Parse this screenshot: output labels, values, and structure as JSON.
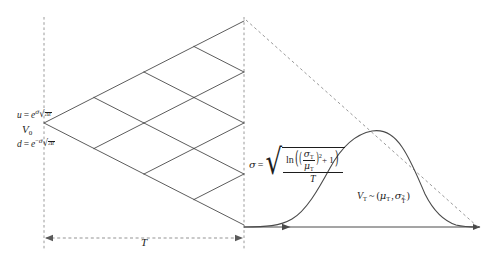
{
  "figure": {
    "domain_kind": "diagram",
    "canvas": {
      "width": 491,
      "height": 260,
      "background": "#ffffff"
    },
    "stroke_color": "#4a4a4a",
    "text_color": "#1d1d1d",
    "dash_color": "#9a9a9a"
  },
  "labels": {
    "up_factor": {
      "name": "u",
      "equals": "=",
      "base": "e",
      "exponent_sigma": "σ",
      "exponent_radicand": "Δt",
      "full_text": "u = e^(σ√Δt)"
    },
    "down_factor": {
      "name": "d",
      "equals": "=",
      "base": "e",
      "exponent_sign": "−",
      "exponent_sigma": "σ",
      "exponent_radicand": "Δt",
      "full_text": "d = e^(−σ√Δt)"
    },
    "initial_value": {
      "name": "V",
      "subscript": "0",
      "full_text": "V₀"
    },
    "time_span": {
      "name": "T",
      "full_text": "T"
    },
    "sigma_formula": {
      "lhs": "σ",
      "equals": "=",
      "ln": "ln",
      "numer_sigma": "σ",
      "numer_sigma_sub": "T",
      "numer_mu": "μ",
      "numer_mu_sub": "T",
      "power": "2",
      "plus_one": "+ 1",
      "denominator": "T",
      "full_text": "σ = √( ln((σ_T/μ_T)² + 1) / T )"
    },
    "terminal_distribution": {
      "lhs_var": "V",
      "lhs_sub": "T",
      "tilde": "~",
      "open": "(",
      "mu": "μ",
      "mu_sub": "T",
      "comma": ",",
      "sigma": "σ",
      "sigma_sub": "T",
      "sigma_pow": "2",
      "close": ")",
      "full_text": "V_T ~ (μ_T, σ_T²)"
    }
  },
  "geometry": {
    "root": {
      "x": 44,
      "y": 123
    },
    "steps": 4,
    "step_dx": 50,
    "step_dy": 25.5,
    "terminal_x": 244,
    "terminal_nodes_y": [
      21,
      72,
      123,
      174,
      225
    ],
    "left_axis_x": 44,
    "left_axis_y_top": 17,
    "left_axis_y_bottom": 250,
    "right_axis_x": 244,
    "right_axis_y_top": 17,
    "right_axis_y_bottom": 250,
    "baseline_y": 227,
    "baseline_x_end": 480,
    "span_arrow_y": 238,
    "span_arrow_x_start": 45,
    "span_arrow_x_end": 243,
    "chord_from": {
      "x": 244,
      "y": 21
    },
    "chord_to": {
      "x": 478,
      "y": 227
    },
    "curve_peak": {
      "x": 390,
      "y": 138
    },
    "curve_start_x": 290,
    "curve_end_x": 478
  },
  "icon_names": {
    "left_time_arrow": "arrow-left-icon",
    "right_time_arrow": "arrow-right-icon",
    "axis_arrow": "arrow-right-icon"
  }
}
